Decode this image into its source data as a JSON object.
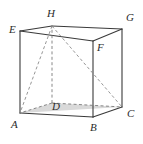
{
  "figure": {
    "name": "cube-with-apex-diagonals",
    "canvas": {
      "width": 143,
      "height": 144,
      "background": "#ffffff"
    },
    "colors": {
      "edge": "#3a3a3a",
      "hidden_edge": "#7a7a7a",
      "diagonal": "#8a8a8a",
      "shade_fill": "#d9d9d9",
      "label": "#2b2b2b"
    },
    "stroke": {
      "edge_width": 1.1,
      "hidden_width": 0.9,
      "dash": "3,2.4"
    },
    "vertices": [
      {
        "id": "E",
        "x": 20,
        "y": 31,
        "label": "E",
        "label_x": 9,
        "label_y": 24,
        "hidden": false
      },
      {
        "id": "H",
        "x": 52,
        "y": 26,
        "label": "H",
        "label_x": 47,
        "label_y": 8,
        "hidden": false
      },
      {
        "id": "G",
        "x": 122,
        "y": 29,
        "label": "G",
        "label_x": 126,
        "label_y": 12,
        "hidden": false
      },
      {
        "id": "F",
        "x": 93,
        "y": 41,
        "label": "F",
        "label_x": 97,
        "label_y": 42,
        "hidden": false
      },
      {
        "id": "A",
        "x": 20,
        "y": 113,
        "label": "A",
        "label_x": 11,
        "label_y": 119,
        "hidden": false
      },
      {
        "id": "D",
        "x": 52,
        "y": 103,
        "label": "D",
        "label_x": 52,
        "label_y": 101,
        "hidden": true
      },
      {
        "id": "C",
        "x": 122,
        "y": 107,
        "label": "C",
        "label_x": 127,
        "label_y": 108,
        "hidden": false
      },
      {
        "id": "B",
        "x": 93,
        "y": 117,
        "label": "B",
        "label_x": 90,
        "label_y": 122,
        "hidden": false
      }
    ],
    "solid_edges": [
      {
        "from": "E",
        "to": "H"
      },
      {
        "from": "H",
        "to": "G"
      },
      {
        "from": "G",
        "to": "F"
      },
      {
        "from": "F",
        "to": "E"
      },
      {
        "from": "A",
        "to": "B"
      },
      {
        "from": "B",
        "to": "C"
      },
      {
        "from": "E",
        "to": "A"
      },
      {
        "from": "F",
        "to": "B"
      },
      {
        "from": "G",
        "to": "C"
      }
    ],
    "hidden_edges": [
      {
        "from": "D",
        "to": "A"
      },
      {
        "from": "D",
        "to": "C"
      },
      {
        "from": "D",
        "to": "H"
      }
    ],
    "diagonals": [
      {
        "from": "H",
        "to": "A"
      },
      {
        "from": "H",
        "to": "C"
      },
      {
        "from": "H",
        "to": "D"
      }
    ],
    "shaded_faces": [
      {
        "name": "triangle-ADC",
        "points": "A D C",
        "fill": "#d9d9d9"
      }
    ]
  }
}
